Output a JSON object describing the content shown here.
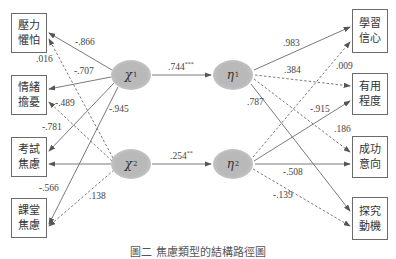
{
  "diagram": {
    "title": "圖二 焦慮類型的結構路徑圖",
    "colors": {
      "line": "#6b6b6b",
      "node_fill": "#b9b9b9",
      "box_border": "#6b6b6b",
      "text": "#333333"
    },
    "left_boxes": [
      {
        "line1": "壓力",
        "line2": "懼怕"
      },
      {
        "line1": "情緒",
        "line2": "擔憂"
      },
      {
        "line1": "考試",
        "line2": "焦慮"
      },
      {
        "line1": "課堂",
        "line2": "焦慮"
      }
    ],
    "right_boxes": [
      {
        "line1": "學習",
        "line2": "信心"
      },
      {
        "line1": "有用",
        "line2": "程度"
      },
      {
        "line1": "成功",
        "line2": "意向"
      },
      {
        "line1": "探究",
        "line2": "動機"
      }
    ],
    "nodes": {
      "chi1": {
        "symbol": "χ",
        "sub": "1"
      },
      "chi2": {
        "symbol": "χ",
        "sub": "2"
      },
      "eta1": {
        "symbol": "η",
        "sub": "1"
      },
      "eta2": {
        "symbol": "η",
        "sub": "2"
      }
    },
    "structural_paths": [
      {
        "from": "χ1",
        "to": "η1",
        "value": ".744",
        "sig": "***"
      },
      {
        "from": "χ2",
        "to": "η2",
        "value": ".254",
        "sig": "**"
      }
    ],
    "left_loadings": {
      "chi1_box1": "-.866",
      "chi2_box1": ".016",
      "chi1_box2": "-.707",
      "chi2_box2": "-.489",
      "chi1_mid": "-.945",
      "chi1_box3": "-.781",
      "chi1_box4": "-.566",
      "chi2_box4": ".138"
    },
    "right_loadings": {
      "eta1_box1": ".983",
      "eta2_box1": ".009",
      "eta1_box2": ".384",
      "eta1_box4": ".787",
      "eta2_box2": "-.915",
      "eta1_box3": ".186",
      "eta2_box3": "-.508",
      "eta2_box4": "-.139"
    }
  }
}
